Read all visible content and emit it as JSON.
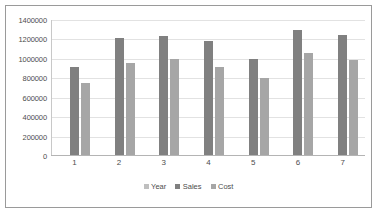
{
  "chart_data": {
    "type": "bar",
    "title": "",
    "subtitle": "",
    "xlabel": "",
    "ylabel": "",
    "categories": [
      "1",
      "2",
      "3",
      "4",
      "5",
      "6",
      "7"
    ],
    "series": [
      {
        "name": "Year",
        "color": "#bfbfbf",
        "values": [
          2009,
          2010,
          2011,
          2012,
          2013,
          2014,
          2015
        ]
      },
      {
        "name": "Sales",
        "color": "#808080",
        "values": [
          920000,
          1220000,
          1240000,
          1180000,
          1000000,
          1300000,
          1245000
        ]
      },
      {
        "name": "Cost",
        "color": "#a6a6a6",
        "values": [
          750000,
          960000,
          1000000,
          920000,
          800000,
          1060000,
          990000
        ]
      }
    ],
    "ylim": [
      0,
      1400000
    ],
    "ytick_values": [
      0,
      200000,
      400000,
      600000,
      800000,
      1000000,
      1200000,
      1400000
    ],
    "ytick_labels": [
      "0",
      "200000",
      "400000",
      "600000",
      "800000",
      "1000000",
      "1200000",
      "1400000"
    ],
    "grid": true,
    "grid_axis": "y",
    "legend": true,
    "legend_position": "bottom",
    "legend_entries": [
      "Year",
      "Sales",
      "Cost"
    ],
    "border_color": "#9a9a9a",
    "gridline_color": "#e2e2e2",
    "background_color": "#ffffff",
    "text_color": "#4d4d4d"
  }
}
